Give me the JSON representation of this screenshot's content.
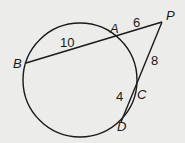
{
  "diagram": {
    "type": "circle-secants",
    "background": "#ececea",
    "stroke": "#1a1a1a",
    "points": {
      "P": "P",
      "A": "A",
      "B": "B",
      "C": "C",
      "D": "D"
    },
    "segments": {
      "PA": "6",
      "AB": "10",
      "PC": "8",
      "CD": "4"
    }
  }
}
